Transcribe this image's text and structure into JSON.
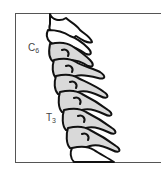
{
  "figure": {
    "type": "anatomical-illustration",
    "labels": [
      {
        "id": "c6",
        "main": "C",
        "sub": "6"
      },
      {
        "id": "t3",
        "main": "T",
        "sub": "3"
      }
    ],
    "colors": {
      "vertebra_fill_shaded": "#d9d9d9",
      "vertebra_fill_unshaded": "#ffffff",
      "outline": "#111111",
      "frame": "#555555",
      "label_text": "#444444"
    }
  }
}
